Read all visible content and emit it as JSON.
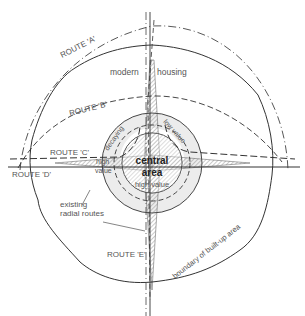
{
  "diagram": {
    "top_caption": "",
    "routes": {
      "a": "ROUTE 'A'",
      "b": "ROUTE 'B'",
      "c": "ROUTE 'C'",
      "d": "ROUTE 'D'",
      "e": "ROUTE 'E'"
    },
    "zones": {
      "modern": "modern",
      "housing": "housing",
      "decaying": "decaying",
      "low_value": "low value",
      "central": "central",
      "area": "area",
      "high_value_center": "high value",
      "high": "high",
      "value": "value"
    },
    "annotations": {
      "existing_1": "existing",
      "existing_2": "radial routes",
      "boundary": "boundary of built-up area"
    },
    "colors": {
      "line": "#333333",
      "text": "#555555",
      "hatch": "#666666",
      "shade": "#e6e6e6"
    }
  }
}
